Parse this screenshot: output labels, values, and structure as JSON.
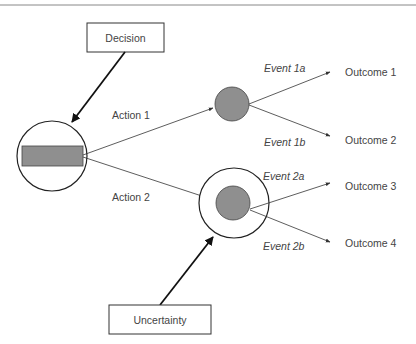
{
  "diagram": {
    "type": "decision-tree",
    "colors": {
      "node_fill": "#8f8f8f",
      "line": "#333333",
      "text": "#444444",
      "top_rule": "#888888"
    },
    "boxes": {
      "decision": "Decision",
      "uncertainty": "Uncertainty"
    },
    "actions": [
      "Action 1",
      "Action 2"
    ],
    "events": [
      "Event 1a",
      "Event 1b",
      "Event 2a",
      "Event 2b"
    ],
    "outcomes": [
      "Outcome 1",
      "Outcome 2",
      "Outcome 3",
      "Outcome 4"
    ]
  }
}
